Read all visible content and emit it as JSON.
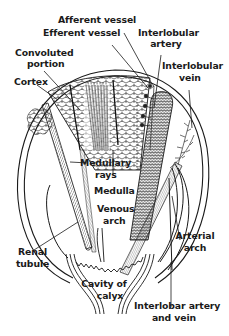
{
  "diagram": {
    "colors": {
      "ink": "#1a1a1a",
      "background": "#ffffff"
    },
    "labels": {
      "afferent_vessel": "Afferent vessel",
      "efferent_vessel": "Efferent vessel",
      "interlobular_artery_1": "Interlobular",
      "interlobular_artery_2": "artery",
      "convoluted_portion_1": "Convoluted",
      "convoluted_portion_2": "portion",
      "cortex": "Cortex",
      "interlobular_vein_1": "Interlobular",
      "interlobular_vein_2": "vein",
      "medullary_rays_1": "Medullary",
      "medullary_rays_2": "rays",
      "medulla": "Medulla",
      "venous_arch_1": "Venous",
      "venous_arch_2": "arch",
      "arterial_arch_1": "Arterial",
      "arterial_arch_2": "arch",
      "renal_tubule_1": "Renal",
      "renal_tubule_2": "tubule",
      "cavity_of_calyx_1": "Cavity of",
      "cavity_of_calyx_2": "calyx",
      "interlobar_1": "Interlobar artery",
      "interlobar_2": "and vein"
    }
  }
}
